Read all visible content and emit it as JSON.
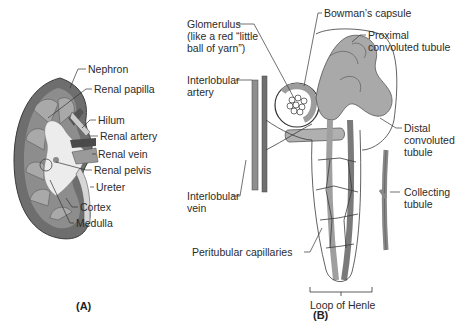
{
  "panel_a": {
    "caption": "(A)",
    "labels": {
      "nephron": "Nephron",
      "renal_papilla": "Renal papilla",
      "hilum": "Hilum",
      "renal_artery": "Renal artery",
      "renal_vein": "Renal vein",
      "renal_pelvis": "Renal pelvis",
      "ureter": "Ureter",
      "cortex": "Cortex",
      "medulla": "Medulla"
    }
  },
  "panel_b": {
    "caption": "(B)",
    "labels": {
      "glomerulus_1": "Glomerulus",
      "glomerulus_2": "(like a red “little",
      "glomerulus_3": "ball of yarn”)",
      "bowmans_capsule": "Bowman’s capsule",
      "proximal_1": "Proximal",
      "proximal_2": "convoluted tubule",
      "interlobular_artery_1": "Interlobular",
      "interlobular_artery_2": "artery",
      "distal_1": "Distal",
      "distal_2": "convoluted",
      "distal_3": "tubule",
      "interlobular_vein_1": "Interlobular",
      "interlobular_vein_2": "vein",
      "collecting_1": "Collecting",
      "collecting_2": "tubule",
      "peritubular": "Peritubular capillaries",
      "loop_of_henle": "Loop of Henle"
    }
  },
  "colors": {
    "tissue_dark": "#6b6b6b",
    "tissue_mid": "#9a9a9a",
    "tissue_light": "#c9c9c9",
    "pelvis": "#e6e6e6",
    "outline": "#3a3a3a"
  }
}
